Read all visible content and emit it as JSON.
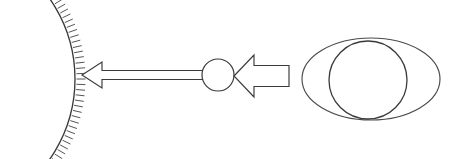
{
  "figure": {
    "background_color": "#ffffff",
    "stroke_color": "#3a3a3a",
    "hatch_color": "#55555a",
    "width": 451,
    "height": 159
  },
  "elements": {
    "large_sphere": {
      "name": "large-hatched-sphere",
      "description": "Large circular arc cropped by the left edge, with short radial hatch marks on its convex outer side",
      "center_x": -65,
      "center_y": 79,
      "radius": 140,
      "hatch_count": 58,
      "hatch_length": 9,
      "arc_start_deg": -62,
      "arc_end_deg": 62
    },
    "thin_arrow": {
      "name": "thin-ray-arrow",
      "description": "Long slender hollow arrow pointing left from the small sphere to the large sphere",
      "direction": "left",
      "tip_x": 82,
      "tail_x": 205,
      "center_y": 75,
      "shaft_height": 9,
      "head_length": 20,
      "head_height": 26
    },
    "small_sphere": {
      "name": "small-sphere",
      "description": "Small open circle between the two arrows",
      "center_x": 218,
      "center_y": 75,
      "radius": 16
    },
    "block_arrow": {
      "name": "block-ray-arrow",
      "description": "Wide hollow block arrow pointing left from the eye toward the small sphere",
      "direction": "left",
      "tip_x": 234,
      "tail_x": 289,
      "center_y": 76,
      "shaft_height": 21,
      "head_length": 20,
      "head_height": 42
    },
    "eye": {
      "name": "eye-shape",
      "description": "Eye drawn as an outer ellipse with an inner iris circle offset toward the left",
      "outer_cx": 371,
      "outer_cy": 79,
      "outer_rx": 69,
      "outer_ry": 41,
      "iris_cx": 368,
      "iris_cy": 80,
      "iris_r": 39
    }
  },
  "labels": {
    "caption": ""
  }
}
